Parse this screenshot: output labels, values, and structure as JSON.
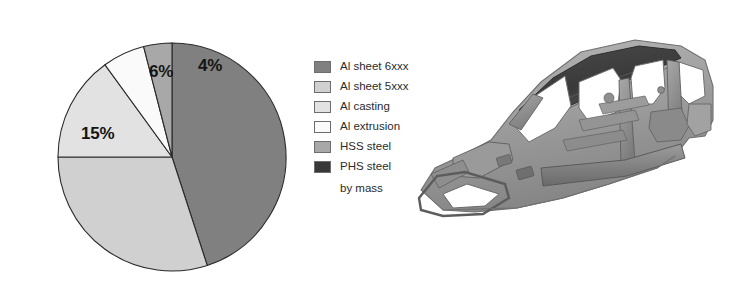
{
  "chart_data": {
    "type": "pie",
    "title": "",
    "subtitle": "",
    "unit_note": "by mass",
    "legend_position": "right",
    "grid": false,
    "categories": [
      "Al sheet 6xxx",
      "Al sheet 5xxx",
      "Al casting",
      "Al extrusion",
      "HSS steel",
      "PHS steel"
    ],
    "values": [
      45,
      30,
      15,
      6,
      4,
      0
    ],
    "value_labels": [
      "",
      "",
      "15%",
      "6%",
      "4%",
      ""
    ],
    "visible_data_labels": [
      "15%",
      "6%",
      "4%"
    ],
    "colors": [
      "#808080",
      "#d0d0d0",
      "#e2e2e2",
      "#fafafa",
      "#a8a8a8",
      "#383838"
    ],
    "start_angle_deg": 0,
    "direction": "clockwise",
    "slices": [
      {
        "label": "Al sheet 6xxx",
        "value": 45,
        "color": "#808080",
        "data_label": "",
        "start_deg": 0,
        "end_deg": 162
      },
      {
        "label": "Al sheet 5xxx",
        "value": 30,
        "color": "#d0d0d0",
        "data_label": "",
        "start_deg": 162,
        "end_deg": 270
      },
      {
        "label": "Al casting",
        "value": 15,
        "color": "#e2e2e2",
        "data_label": "15%",
        "start_deg": 270,
        "end_deg": 324
      },
      {
        "label": "Al extrusion",
        "value": 6,
        "color": "#fafafa",
        "data_label": "6%",
        "start_deg": 324,
        "end_deg": 345.6
      },
      {
        "label": "HSS steel",
        "value": 4,
        "color": "#a8a8a8",
        "data_label": "4%",
        "start_deg": 345.6,
        "end_deg": 360
      },
      {
        "label": "PHS steel",
        "value": 0,
        "color": "#383838",
        "data_label": "",
        "start_deg": 360,
        "end_deg": 360
      }
    ]
  },
  "pie_labels": {
    "casting": "15%",
    "extrusion": "6%",
    "hss": "4%"
  },
  "legend": {
    "items": [
      {
        "label": "Al sheet 6xxx",
        "color": "#808080"
      },
      {
        "label": "Al sheet 5xxx",
        "color": "#d0d0d0"
      },
      {
        "label": "Al casting",
        "color": "#e2e2e2"
      },
      {
        "label": "Al extrusion",
        "color": "#fafafa"
      },
      {
        "label": "HSS steel",
        "color": "#a8a8a8"
      },
      {
        "label": "PHS steel",
        "color": "#383838"
      }
    ],
    "note": "by mass"
  },
  "photo": {
    "alt": "car-body-in-white-structure"
  }
}
